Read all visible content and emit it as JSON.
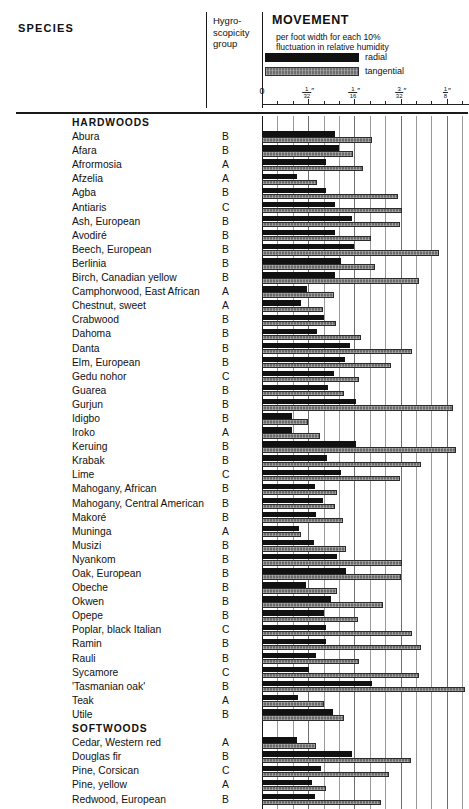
{
  "header": {
    "species_label": "SPECIES",
    "hygro_label": "Hygro-\nscopicity\ngroup",
    "hygro_line1": "Hygro-",
    "hygro_line2": "scopicity",
    "hygro_line3": "group",
    "movement_title": "MOVEMENT",
    "movement_sub": "per foot width for each 10% fluctuation in relative humidity",
    "legend": [
      {
        "key": "radial",
        "label": "radial",
        "color": "#111111"
      },
      {
        "key": "tangential",
        "label": "tangential",
        "color": "#6a6a6a"
      }
    ]
  },
  "axis": {
    "labels": [
      "0",
      "1/32\"",
      "1/16\"",
      "3/32\"",
      "1/8\""
    ],
    "values": [
      0,
      0.03125,
      0.0625,
      0.09375,
      0.125
    ],
    "unit": "inch",
    "max": 0.14,
    "minor_ticks_per_major": 2
  },
  "chart_data": {
    "type": "bar",
    "orientation": "horizontal",
    "title": "MOVEMENT per foot width for each 10% fluctuation in relative humidity",
    "xlabel": "",
    "ylabel": "SPECIES",
    "xlim": [
      0,
      0.14
    ],
    "xtick_labels": [
      "0",
      "1/32\"",
      "1/16\"",
      "3/32\"",
      "1/8\""
    ],
    "xtick_values": [
      0,
      0.03125,
      0.0625,
      0.09375,
      0.125
    ],
    "grid": true,
    "legend_position": "top",
    "series": [
      {
        "name": "radial",
        "color": "#111111"
      },
      {
        "name": "tangential",
        "color": "#6a6a6a"
      }
    ],
    "rows": [
      {
        "name": "HARDWOODS",
        "group": true
      },
      {
        "name": "Abura",
        "hygro": "B",
        "radial": 0.0492,
        "tangential": 0.0742
      },
      {
        "name": "Afara",
        "hygro": "B",
        "radial": 0.0523,
        "tangential": 0.0617
      },
      {
        "name": "Afrormosia",
        "hygro": "A",
        "radial": 0.043,
        "tangential": 0.068
      },
      {
        "name": "Afzelia",
        "hygro": "A",
        "radial": 0.0234,
        "tangential": 0.0375
      },
      {
        "name": "Agba",
        "hygro": "B",
        "radial": 0.043,
        "tangential": 0.0922
      },
      {
        "name": "Antiaris",
        "hygro": "C",
        "radial": 0.0492,
        "tangential": 0.0945
      },
      {
        "name": "Ash, European",
        "hygro": "B",
        "radial": 0.0609,
        "tangential": 0.093
      },
      {
        "name": "Avodiré",
        "hygro": "B",
        "radial": 0.0492,
        "tangential": 0.0734
      },
      {
        "name": "Beech, European",
        "hygro": "B",
        "radial": 0.0625,
        "tangential": 0.1195
      },
      {
        "name": "Berlinia",
        "hygro": "B",
        "radial": 0.0531,
        "tangential": 0.0766
      },
      {
        "name": "Birch, Canadian yellow",
        "hygro": "B",
        "radial": 0.0492,
        "tangential": 0.1063
      },
      {
        "name": "Camphorwood, East African",
        "hygro": "A",
        "radial": 0.0305,
        "tangential": 0.0484
      },
      {
        "name": "Chestnut, sweet",
        "hygro": "A",
        "radial": 0.0266,
        "tangential": 0.0414
      },
      {
        "name": "Crabwood",
        "hygro": "B",
        "radial": 0.0422,
        "tangential": 0.05
      },
      {
        "name": "Dahoma",
        "hygro": "B",
        "radial": 0.0375,
        "tangential": 0.0672
      },
      {
        "name": "Danta",
        "hygro": "B",
        "radial": 0.0594,
        "tangential": 0.1016
      },
      {
        "name": "Elm, European",
        "hygro": "B",
        "radial": 0.0563,
        "tangential": 0.0875
      },
      {
        "name": "Gedu nohor",
        "hygro": "C",
        "radial": 0.0484,
        "tangential": 0.0656
      },
      {
        "name": "Guarea",
        "hygro": "B",
        "radial": 0.0445,
        "tangential": 0.0555
      },
      {
        "name": "Gurjun",
        "hygro": "B",
        "radial": 0.0633,
        "tangential": 0.1289
      },
      {
        "name": "Idigbo",
        "hygro": "B",
        "radial": 0.0203,
        "tangential": 0.0313
      },
      {
        "name": "Iroko",
        "hygro": "A",
        "radial": 0.0203,
        "tangential": 0.0391
      },
      {
        "name": "Keruing",
        "hygro": "B",
        "radial": 0.0633,
        "tangential": 0.1313
      },
      {
        "name": "Krabak",
        "hygro": "B",
        "radial": 0.0438,
        "tangential": 0.1078
      },
      {
        "name": "Lime",
        "hygro": "C",
        "radial": 0.0531,
        "tangential": 0.093
      },
      {
        "name": "Mahogany, African",
        "hygro": "B",
        "radial": 0.0359,
        "tangential": 0.0508
      },
      {
        "name": "Mahogany, Central American",
        "hygro": "B",
        "radial": 0.0414,
        "tangential": 0.0492
      },
      {
        "name": "Makoré",
        "hygro": "B",
        "radial": 0.0367,
        "tangential": 0.0547
      },
      {
        "name": "Muninga",
        "hygro": "A",
        "radial": 0.025,
        "tangential": 0.0266
      },
      {
        "name": "Musizi",
        "hygro": "B",
        "radial": 0.0352,
        "tangential": 0.057
      },
      {
        "name": "Nyankom",
        "hygro": "B",
        "radial": 0.0508,
        "tangential": 0.0945
      },
      {
        "name": "Oak, European",
        "hygro": "B",
        "radial": 0.057,
        "tangential": 0.0938
      },
      {
        "name": "Obeche",
        "hygro": "B",
        "radial": 0.0297,
        "tangential": 0.0508
      },
      {
        "name": "Okwen",
        "hygro": "B",
        "radial": 0.0469,
        "tangential": 0.082
      },
      {
        "name": "Opepe",
        "hygro": "B",
        "radial": 0.0422,
        "tangential": 0.0648
      },
      {
        "name": "Poplar, black Italian",
        "hygro": "C",
        "radial": 0.043,
        "tangential": 0.1016
      },
      {
        "name": "Ramin",
        "hygro": "B",
        "radial": 0.043,
        "tangential": 0.1078
      },
      {
        "name": "Rauli",
        "hygro": "B",
        "radial": 0.0367,
        "tangential": 0.0656
      },
      {
        "name": "Sycamore",
        "hygro": "C",
        "radial": 0.032,
        "tangential": 0.1063
      },
      {
        "name": "'Tasmanian oak'",
        "hygro": "B",
        "radial": 0.0742,
        "tangential": 0.1375
      },
      {
        "name": "Teak",
        "hygro": "A",
        "radial": 0.0242,
        "tangential": 0.0422
      },
      {
        "name": "Utile",
        "hygro": "B",
        "radial": 0.0477,
        "tangential": 0.0555
      },
      {
        "name": "SOFTWOODS",
        "group": true
      },
      {
        "name": "Cedar, Western red",
        "hygro": "A",
        "radial": 0.0234,
        "tangential": 0.0367
      },
      {
        "name": "Douglas fir",
        "hygro": "B",
        "radial": 0.0609,
        "tangential": 0.1008
      },
      {
        "name": "Pine, Corsican",
        "hygro": "C",
        "radial": 0.0398,
        "tangential": 0.0859
      },
      {
        "name": "Pine, yellow",
        "hygro": "A",
        "radial": 0.0336,
        "tangential": 0.043
      },
      {
        "name": "Redwood, European",
        "hygro": "B",
        "radial": 0.0359,
        "tangential": 0.0805
      }
    ]
  }
}
